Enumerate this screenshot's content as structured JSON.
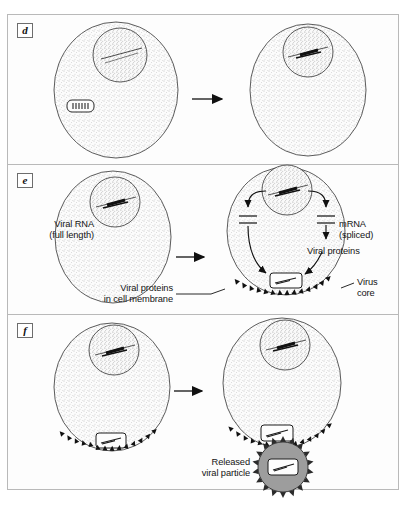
{
  "figure": {
    "panels": [
      {
        "id": "d",
        "label": "d",
        "description": "Viral core in cytoplasm; provirus integrated into nuclear DNA",
        "arrow": "right-arrow"
      },
      {
        "id": "e",
        "label": "e",
        "description": "Transcription of provirus into viral RNA and mRNA; assembly at membrane",
        "arrow": "right-arrow",
        "labels": {
          "viral_rna": "Viral RNA\n(full length)",
          "viral_rna_line1": "Viral RNA",
          "viral_rna_line2": "(full length)",
          "mrna": "mRNA\n(spliced)",
          "mrna_line1": "mRNA",
          "mrna_line2": "(spliced)",
          "viral_proteins": "Viral proteins",
          "membrane_proteins_line1": "Viral proteins",
          "membrane_proteins_line2": "in cell membrane",
          "virus_core_line1": "Virus",
          "virus_core_line2": "core"
        }
      },
      {
        "id": "f",
        "label": "f",
        "description": "Budding of virion through cell membrane and release of mature viral particle",
        "arrow": "right-arrow",
        "labels": {
          "released_line1": "Released",
          "released_line2": "viral particle"
        }
      }
    ]
  },
  "colors": {
    "frame_border": "#b9b9b9",
    "ink": "#1a1a1a",
    "cell_fill": "#fbfbfb",
    "stipple": "#8a8a8a",
    "virion_fill": "#9d9d9d",
    "background": "#ffffff"
  },
  "icons": {
    "arrow": "right-arrow-icon",
    "cell": "cell-icon",
    "nucleus": "nucleus-icon",
    "provirus": "provirus-dna-icon",
    "viral_core": "viral-core-icon",
    "spike": "membrane-spike-icon",
    "virion": "released-virion-icon"
  }
}
